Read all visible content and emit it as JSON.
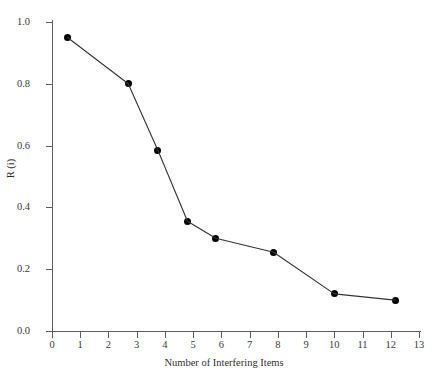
{
  "chart_data": {
    "type": "line",
    "title": "",
    "subtitle": "",
    "xlabel": "Number of Interfering Items",
    "ylabel": "R (i)",
    "xlim": [
      0,
      13
    ],
    "ylim": [
      0.0,
      1.0
    ],
    "grid": false,
    "legend": null,
    "marker": "filled-circle",
    "marker_color": "#000000",
    "line_color": "#333333",
    "xticks": [
      0,
      1,
      2,
      3,
      4,
      5,
      6,
      7,
      8,
      9,
      10,
      11,
      12,
      13
    ],
    "xtick_labels": [
      "0",
      "1",
      "2",
      "3",
      "4",
      "5",
      "6",
      "7",
      "8",
      "9",
      "10",
      "11",
      "12",
      "13"
    ],
    "yticks": [
      0.0,
      0.2,
      0.4,
      0.6,
      0.8,
      1.0
    ],
    "ytick_labels": [
      "0.0",
      "0.2",
      "0.4",
      "0.6",
      "0.8",
      "1.0"
    ],
    "x": [
      0.55,
      2.7,
      3.75,
      4.8,
      5.8,
      7.85,
      10.0,
      12.15
    ],
    "values": [
      0.95,
      0.8,
      0.585,
      0.355,
      0.3,
      0.255,
      0.12,
      0.1
    ],
    "points": [
      {
        "x": 0.55,
        "y": 0.95
      },
      {
        "x": 2.7,
        "y": 0.8
      },
      {
        "x": 3.75,
        "y": 0.585
      },
      {
        "x": 4.8,
        "y": 0.355
      },
      {
        "x": 5.8,
        "y": 0.3
      },
      {
        "x": 7.85,
        "y": 0.255
      },
      {
        "x": 10.0,
        "y": 0.12
      },
      {
        "x": 12.15,
        "y": 0.1
      }
    ]
  }
}
